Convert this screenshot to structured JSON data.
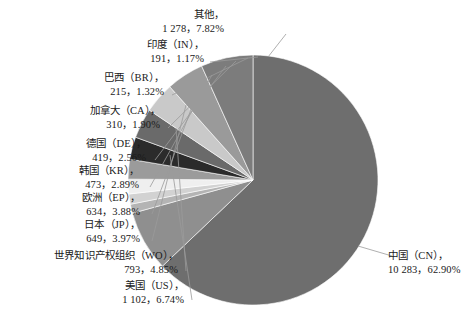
{
  "chart_data": {
    "type": "pie",
    "title": "",
    "subtitle": "",
    "xlabel": "",
    "ylabel": "",
    "legend_position": "none",
    "grid": false,
    "label_format": "name, count, percent",
    "total": 16347,
    "categories": [
      "中国（CN）",
      "其他",
      "印度（IN）",
      "巴西（BR）",
      "加拿大（CA）",
      "德国（DE）",
      "韩国（KR）",
      "欧洲（EP）",
      "日本（JP）",
      "世界知识产权组织（WO）",
      "美国（US）"
    ],
    "values": [
      10283,
      1278,
      191,
      215,
      310,
      419,
      473,
      634,
      649,
      793,
      1102
    ],
    "percents": [
      62.9,
      7.82,
      1.17,
      1.32,
      1.9,
      2.56,
      2.89,
      3.88,
      3.97,
      4.85,
      6.74
    ],
    "value_display": [
      "10 283",
      "1 278",
      "191",
      "215",
      "310",
      "419",
      "473",
      "634",
      "649",
      "793",
      "1 102"
    ],
    "percent_display": [
      "62.90%",
      "7.82%",
      "1.17%",
      "1.32%",
      "1.90%",
      "2.56%",
      "2.89%",
      "3.88%",
      "3.97%",
      "4.85%",
      "6.74%"
    ],
    "colors": [
      "#6e6e6e",
      "#8f8f8f",
      "#b4b4b4",
      "#d2d2d2",
      "#efefef",
      "#9b9b9b",
      "#2b2b2b",
      "#6a6a6a",
      "#c9c9c9",
      "#9a9a9a",
      "#7c7c7c"
    ],
    "slices": [
      {
        "name": "中国（CN）",
        "value": 10283,
        "value_display": "10 283",
        "percent": 62.9,
        "percent_display": "62.90%",
        "color": "#6e6e6e",
        "label_line1": "中国（CN），",
        "label_line2": "10 283，62.90%"
      },
      {
        "name": "其他",
        "value": 1278,
        "value_display": "1 278",
        "percent": 7.82,
        "percent_display": "7.82%",
        "color": "#8f8f8f",
        "label_line1": "其他，",
        "label_line2": "1 278，7.82%"
      },
      {
        "name": "印度（IN）",
        "value": 191,
        "value_display": "191",
        "percent": 1.17,
        "percent_display": "1.17%",
        "color": "#b4b4b4",
        "label_line1": "印度（IN），",
        "label_line2": "191，1.17%"
      },
      {
        "name": "巴西（BR）",
        "value": 215,
        "value_display": "215",
        "percent": 1.32,
        "percent_display": "1.32%",
        "color": "#d2d2d2",
        "label_line1": "巴西（BR），",
        "label_line2": "215，1.32%"
      },
      {
        "name": "加拿大（CA）",
        "value": 310,
        "value_display": "310",
        "percent": 1.9,
        "percent_display": "1.90%",
        "color": "#efefef",
        "label_line1": "加拿大（CA），",
        "label_line2": "310，1.90%"
      },
      {
        "name": "德国（DE）",
        "value": 419,
        "value_display": "419",
        "percent": 2.56,
        "percent_display": "2.56%",
        "color": "#9b9b9b",
        "label_line1": "德国（DE），",
        "label_line2": "419，2.56%"
      },
      {
        "name": "韩国（KR）",
        "value": 473,
        "value_display": "473",
        "percent": 2.89,
        "percent_display": "2.89%",
        "color": "#2b2b2b",
        "label_line1": "韩国（KR），",
        "label_line2": "473，2.89%"
      },
      {
        "name": "欧洲（EP）",
        "value": 634,
        "value_display": "634",
        "percent": 3.88,
        "percent_display": "3.88%",
        "color": "#6a6a6a",
        "label_line1": "欧洲（EP），",
        "label_line2": "634，3.88%"
      },
      {
        "name": "日本（JP）",
        "value": 649,
        "value_display": "649",
        "percent": 3.97,
        "percent_display": "3.97%",
        "color": "#c9c9c9",
        "label_line1": "日本（JP），",
        "label_line2": "649，3.97%"
      },
      {
        "name": "世界知识产权组织（WO）",
        "value": 793,
        "value_display": "793",
        "percent": 4.85,
        "percent_display": "4.85%",
        "color": "#9a9a9a",
        "label_line1": "世界知识产权组织（WO），",
        "label_line2": "793，4.85%"
      },
      {
        "name": "美国（US）",
        "value": 1102,
        "value_display": "1 102",
        "percent": 6.74,
        "percent_display": "6.74%",
        "color": "#7c7c7c",
        "label_line1": "美国（US），",
        "label_line2": "1 102，6.74%"
      }
    ]
  },
  "geometry": {
    "center_x": 253,
    "center_y": 180,
    "radius": 125,
    "start_angle_deg": -90,
    "direction": "clockwise"
  }
}
